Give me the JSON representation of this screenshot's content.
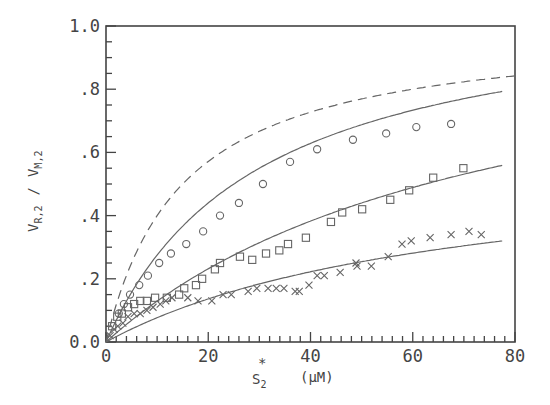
{
  "chart_data": {
    "type": "scatter",
    "title": "",
    "xlabel": "S2* (µM)",
    "xlabel_parts": {
      "main": "S",
      "sub": "2",
      "sup": "*",
      "unit": "(µM)"
    },
    "ylabel": "VR,2 / VM,2",
    "ylabel_parts": {
      "num": "V",
      "num_sub": "R,2",
      "sep": "/",
      "den": "V",
      "den_sub": "M,2"
    },
    "xlim": [
      0,
      80
    ],
    "ylim": [
      0,
      1.0
    ],
    "grid": false,
    "legend": null,
    "x_ticks": [
      {
        "value": 0,
        "label": "0"
      },
      {
        "value": 20,
        "label": "20"
      },
      {
        "value": 40,
        "label": "40"
      },
      {
        "value": 60,
        "label": "60"
      },
      {
        "value": 80,
        "label": "80"
      }
    ],
    "y_ticks": [
      {
        "value": 0,
        "label": "0.0"
      },
      {
        "value": 0.2,
        "label": ".2"
      },
      {
        "value": 0.4,
        "label": ".4"
      },
      {
        "value": 0.6,
        "label": ".6"
      },
      {
        "value": 0.8,
        "label": ".8"
      },
      {
        "value": 1.0,
        "label": "1.0"
      }
    ],
    "series": [
      {
        "name": "circles",
        "marker": "circle",
        "x": [
          2.5,
          3.5,
          4.7,
          6.5,
          8.2,
          10.4,
          12.7,
          15.7,
          19.0,
          22.3,
          26.0,
          30.7,
          36.0,
          41.3,
          48.3,
          54.8,
          60.7,
          67.5
        ],
        "y": [
          0.09,
          0.12,
          0.15,
          0.18,
          0.21,
          0.25,
          0.28,
          0.31,
          0.35,
          0.4,
          0.44,
          0.5,
          0.57,
          0.61,
          0.64,
          0.66,
          0.68,
          0.69
        ]
      },
      {
        "name": "squares",
        "marker": "square",
        "x": [
          1.2,
          2.2,
          3.1,
          4.3,
          5.5,
          6.7,
          8.0,
          9.6,
          11.9,
          14.3,
          15.3,
          17.6,
          18.8,
          21.3,
          22.3,
          26.2,
          28.6,
          31.3,
          33.9,
          35.6,
          39.1,
          44.0,
          46.2,
          50.1,
          55.6,
          59.3,
          64.0,
          69.9
        ],
        "y": [
          0.05,
          0.08,
          0.09,
          0.11,
          0.12,
          0.13,
          0.13,
          0.14,
          0.14,
          0.15,
          0.17,
          0.18,
          0.2,
          0.23,
          0.25,
          0.27,
          0.26,
          0.28,
          0.29,
          0.31,
          0.33,
          0.38,
          0.41,
          0.42,
          0.45,
          0.48,
          0.52,
          0.55
        ]
      },
      {
        "name": "crosses",
        "marker": "cross",
        "x": [
          0.8,
          1.6,
          2.3,
          3.3,
          4.3,
          5.5,
          6.7,
          8.0,
          9.2,
          10.6,
          11.7,
          12.9,
          16.0,
          18.0,
          20.7,
          22.9,
          24.5,
          27.8,
          29.5,
          31.7,
          33.3,
          34.8,
          37.0,
          37.8,
          39.7,
          41.3,
          42.7,
          45.8,
          48.9,
          49.1,
          51.9,
          55.2,
          57.9,
          59.7,
          63.4,
          67.5,
          71.0,
          73.4
        ],
        "y": [
          0.02,
          0.04,
          0.05,
          0.06,
          0.08,
          0.09,
          0.09,
          0.1,
          0.11,
          0.12,
          0.13,
          0.14,
          0.14,
          0.13,
          0.13,
          0.15,
          0.15,
          0.16,
          0.17,
          0.17,
          0.17,
          0.17,
          0.16,
          0.16,
          0.18,
          0.21,
          0.21,
          0.22,
          0.25,
          0.24,
          0.24,
          0.27,
          0.31,
          0.32,
          0.33,
          0.34,
          0.35,
          0.34
        ]
      }
    ],
    "curves": [
      {
        "name": "dashed-theoretical",
        "style": "dashed",
        "vmax": 1.0,
        "km": 15,
        "x_range": [
          0,
          80
        ]
      },
      {
        "name": "fit-circles",
        "style": "solid",
        "vmax": 1.1,
        "km": 30,
        "x_range": [
          0,
          77.5
        ]
      },
      {
        "name": "fit-squares",
        "style": "solid",
        "vmax": 1.1,
        "km": 75,
        "x_range": [
          0,
          77.5
        ]
      },
      {
        "name": "fit-crosses",
        "style": "solid",
        "vmax": 0.6,
        "km": 68,
        "x_range": [
          0,
          77.5
        ]
      }
    ],
    "colors": {
      "ink": "#444444",
      "curve": "#666666",
      "background": "#ffffff"
    }
  }
}
